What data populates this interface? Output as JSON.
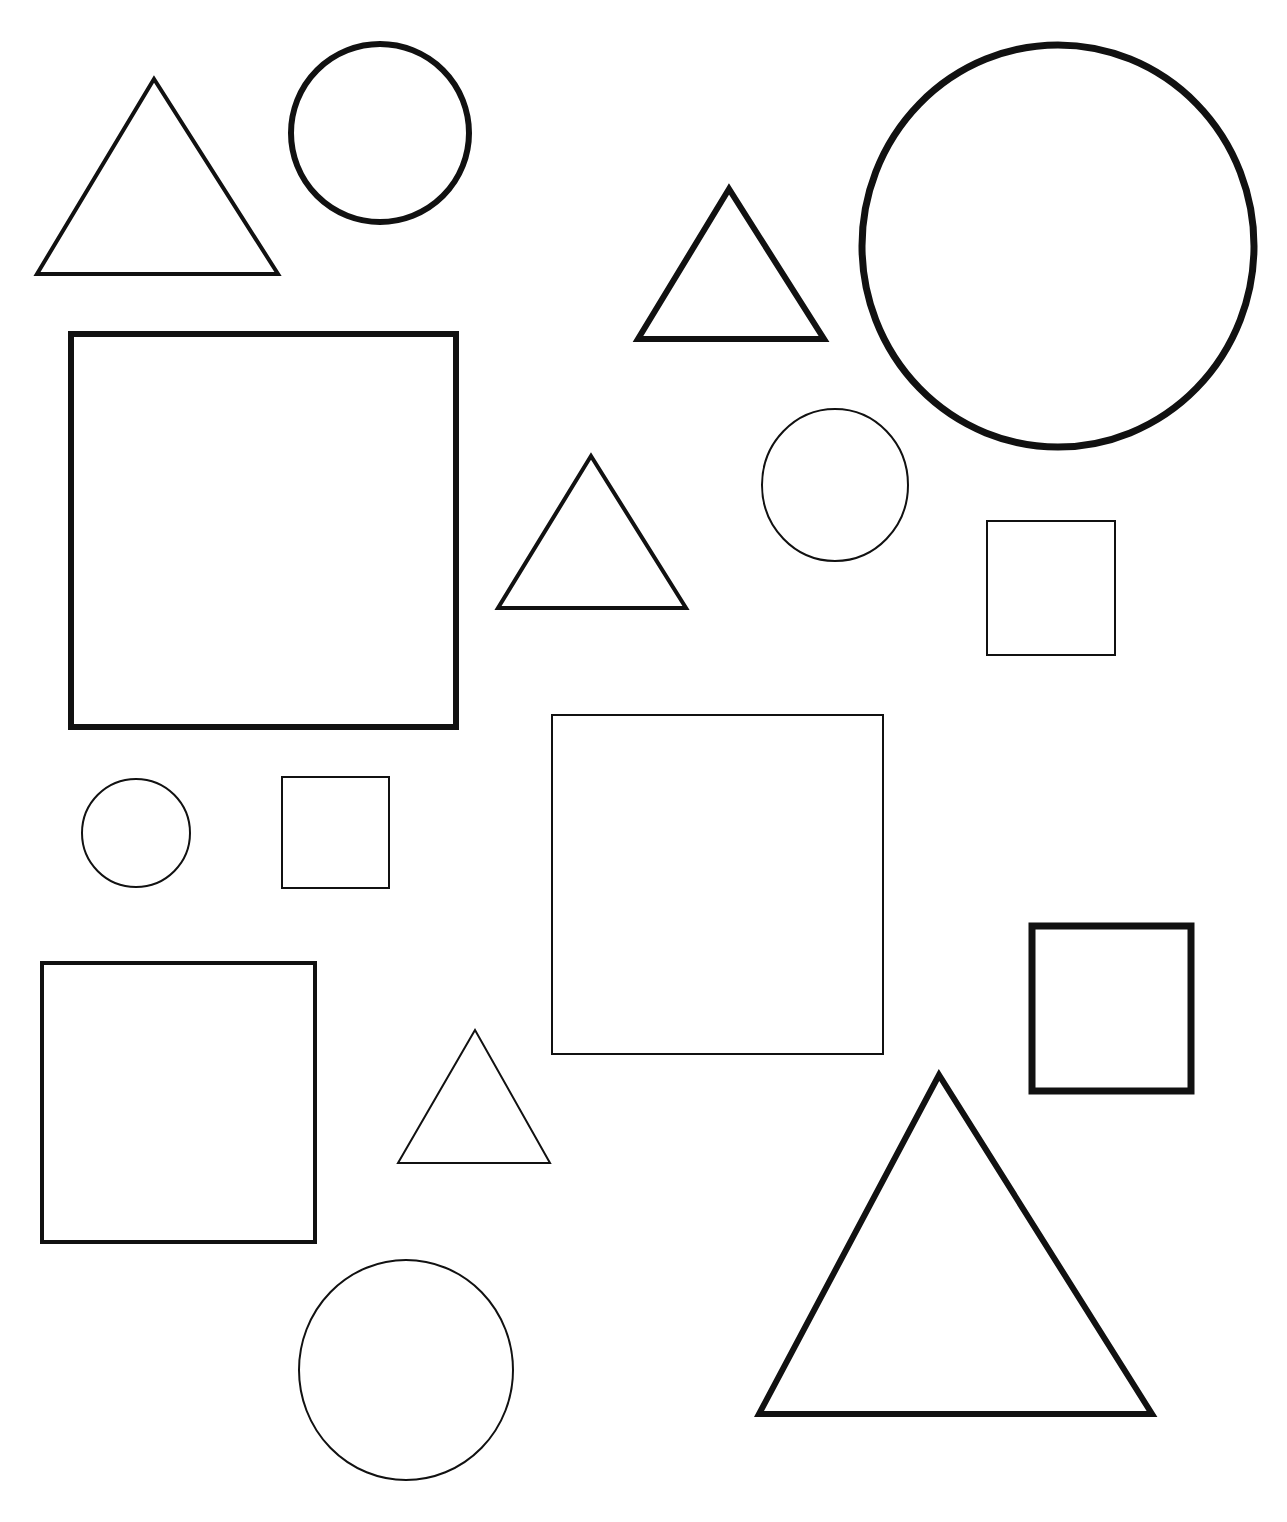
{
  "page": {
    "background": "#ffffff",
    "stroke_color": "#111111"
  },
  "shapes": [
    {
      "type": "triangle",
      "label": "triangle-1",
      "points": [
        [
          154,
          79
        ],
        [
          37,
          274
        ],
        [
          278,
          274
        ]
      ],
      "stroke": 4
    },
    {
      "type": "circle",
      "label": "circle-1",
      "cx": 380,
      "cy": 133,
      "r": 89,
      "stroke": 6
    },
    {
      "type": "triangle",
      "label": "triangle-2",
      "points": [
        [
          729,
          189
        ],
        [
          638,
          339
        ],
        [
          824,
          339
        ]
      ],
      "stroke": 6
    },
    {
      "type": "circle",
      "label": "circle-2",
      "cx": 1058,
      "cy": 246,
      "rx": 196,
      "ry": 201,
      "stroke": 7
    },
    {
      "type": "square",
      "label": "square-1",
      "x": 71,
      "y": 334,
      "w": 385,
      "h": 393,
      "stroke": 6
    },
    {
      "type": "triangle",
      "label": "triangle-3",
      "points": [
        [
          591,
          456
        ],
        [
          498,
          608
        ],
        [
          686,
          608
        ]
      ],
      "stroke": 4
    },
    {
      "type": "circle",
      "label": "circle-3",
      "cx": 835,
      "cy": 485,
      "rx": 73,
      "ry": 76,
      "stroke": 2
    },
    {
      "type": "square",
      "label": "square-2",
      "x": 987,
      "y": 521,
      "w": 128,
      "h": 134,
      "stroke": 2
    },
    {
      "type": "square",
      "label": "square-3",
      "x": 552,
      "y": 715,
      "w": 331,
      "h": 339,
      "stroke": 2
    },
    {
      "type": "circle",
      "label": "circle-4",
      "cx": 136,
      "cy": 833,
      "r": 54,
      "stroke": 2
    },
    {
      "type": "square",
      "label": "square-4",
      "x": 282,
      "y": 777,
      "w": 107,
      "h": 111,
      "stroke": 2
    },
    {
      "type": "square",
      "label": "square-5",
      "x": 42,
      "y": 963,
      "w": 273,
      "h": 279,
      "stroke": 4
    },
    {
      "type": "square",
      "label": "square-6",
      "x": 1032,
      "y": 926,
      "w": 159,
      "h": 165,
      "stroke": 7
    },
    {
      "type": "triangle",
      "label": "triangle-4",
      "points": [
        [
          475,
          1030
        ],
        [
          398,
          1163
        ],
        [
          550,
          1163
        ]
      ],
      "stroke": 2
    },
    {
      "type": "circle",
      "label": "circle-5",
      "cx": 406,
      "cy": 1370,
      "rx": 107,
      "ry": 110,
      "stroke": 2
    },
    {
      "type": "triangle",
      "label": "triangle-5",
      "points": [
        [
          939,
          1075
        ],
        [
          759,
          1414
        ],
        [
          1152,
          1414
        ]
      ],
      "stroke": 6
    }
  ]
}
